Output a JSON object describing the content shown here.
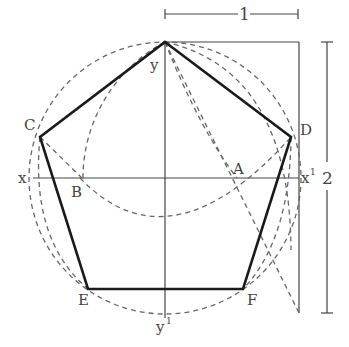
{
  "diagram": {
    "points": {
      "y": "y",
      "y_prime": "y",
      "y_prime_sup": "1",
      "x": "x",
      "x_prime": "x",
      "x_prime_sup": "1",
      "A": "A",
      "B": "B",
      "C": "C",
      "D": "D",
      "E": "E",
      "F": "F"
    },
    "dimensions": {
      "width_label": "1",
      "height_label": "2"
    },
    "colors": {
      "thick_line": "#1a1a1a",
      "thin_line": "#444444",
      "dashed_line": "#666666",
      "background": "#ffffff"
    }
  }
}
